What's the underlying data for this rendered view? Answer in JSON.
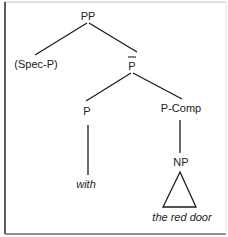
{
  "diagram": {
    "type": "syntax-tree",
    "nodes": {
      "root": "PP",
      "spec": "(Spec-P)",
      "pbar": "P",
      "head": "P",
      "comp": "P-Comp",
      "np": "NP",
      "head_word": "with",
      "np_words": "the red door"
    },
    "edges": [
      [
        "PP",
        "(Spec-P)"
      ],
      [
        "PP",
        "P-bar"
      ],
      [
        "P-bar",
        "P"
      ],
      [
        "P-bar",
        "P-Comp"
      ],
      [
        "P",
        "with"
      ],
      [
        "P-Comp",
        "NP"
      ],
      [
        "NP",
        "the red door (triangle)"
      ]
    ],
    "colors": {
      "line": "#1a1a1a",
      "text": "#222222",
      "background": "#ffffff"
    }
  }
}
